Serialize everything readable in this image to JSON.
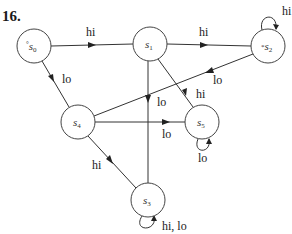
{
  "problem": {
    "number": "16.",
    "top_fragment": ""
  },
  "nodes": [
    {
      "id": "s0",
      "label": "s",
      "sub": "0",
      "marker": "°",
      "initial": true,
      "x": 34,
      "y": 46
    },
    {
      "id": "s1",
      "label": "s",
      "sub": "1",
      "marker": "",
      "x": 150,
      "y": 44
    },
    {
      "id": "s2",
      "label": "s",
      "sub": "2",
      "marker": "*",
      "accepting": true,
      "x": 268,
      "y": 46
    },
    {
      "id": "s4",
      "label": "s",
      "sub": "4",
      "marker": "",
      "x": 78,
      "y": 122
    },
    {
      "id": "s5",
      "label": "s",
      "sub": "5",
      "marker": "",
      "x": 202,
      "y": 122
    },
    {
      "id": "s3",
      "label": "s",
      "sub": "3",
      "marker": "",
      "x": 148,
      "y": 200
    }
  ],
  "edges": [
    {
      "from": "s0",
      "to": "s1",
      "label": "hi"
    },
    {
      "from": "s0",
      "to": "s4",
      "label": "lo"
    },
    {
      "from": "s1",
      "to": "s2",
      "label": "hi"
    },
    {
      "from": "s1",
      "to": "s3",
      "label": "lo"
    },
    {
      "from": "s2",
      "to": "s2",
      "label": "hi"
    },
    {
      "from": "s2",
      "to": "s4",
      "label": "lo"
    },
    {
      "from": "s5",
      "to": "s1",
      "label": "hi"
    },
    {
      "from": "s4",
      "to": "s5",
      "label": "lo"
    },
    {
      "from": "s4",
      "to": "s3",
      "label": "hi"
    },
    {
      "from": "s5",
      "to": "s5",
      "label": "lo"
    },
    {
      "from": "s3",
      "to": "s3",
      "label": "hi, lo"
    }
  ]
}
